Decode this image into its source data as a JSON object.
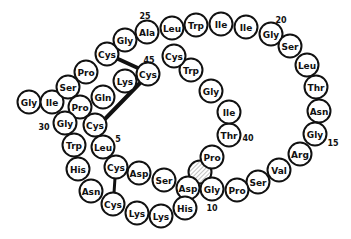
{
  "diagram": {
    "type": "peptide-sequence-loop",
    "residue_radius": 11.5,
    "colors": {
      "outline": "#111111",
      "fill": "#ffffff",
      "hatch": "#aaaaaa"
    },
    "residues": [
      {
        "label": "Gly",
        "x": 29,
        "y": 102
      },
      {
        "label": "Ile",
        "x": 52,
        "y": 102
      },
      {
        "label": "Ser",
        "x": 68,
        "y": 87
      },
      {
        "label": "Pro",
        "x": 80,
        "y": 107
      },
      {
        "label": "Pro",
        "x": 86,
        "y": 72
      },
      {
        "label": "Cys",
        "x": 107,
        "y": 54
      },
      {
        "label": "Gly",
        "x": 125,
        "y": 40
      },
      {
        "label": "Ala",
        "x": 147,
        "y": 32
      },
      {
        "label": "Leu",
        "x": 172,
        "y": 28
      },
      {
        "label": "Trp",
        "x": 196,
        "y": 25
      },
      {
        "label": "Ile",
        "x": 221,
        "y": 24
      },
      {
        "label": "Ile",
        "x": 246,
        "y": 27
      },
      {
        "label": "Gly",
        "x": 271,
        "y": 34
      },
      {
        "label": "Ser",
        "x": 290,
        "y": 46
      },
      {
        "label": "Leu",
        "x": 307,
        "y": 65
      },
      {
        "label": "Thr",
        "x": 316,
        "y": 87
      },
      {
        "label": "Asn",
        "x": 319,
        "y": 111
      },
      {
        "label": "Gly",
        "x": 315,
        "y": 134
      },
      {
        "label": "Arg",
        "x": 300,
        "y": 154
      },
      {
        "label": "Val",
        "x": 279,
        "y": 170
      },
      {
        "label": "Ser",
        "x": 258,
        "y": 182
      },
      {
        "label": "Pro",
        "x": 237,
        "y": 190
      },
      {
        "label": "Gly",
        "x": 212,
        "y": 189
      },
      {
        "label": "Asp",
        "x": 188,
        "y": 188
      },
      {
        "label": "His",
        "x": 185,
        "y": 208
      },
      {
        "label": "Lys",
        "x": 161,
        "y": 216
      },
      {
        "label": "Lys",
        "x": 137,
        "y": 213
      },
      {
        "label": "Cys",
        "x": 113,
        "y": 204
      },
      {
        "label": "Asn",
        "x": 91,
        "y": 191
      },
      {
        "label": "His",
        "x": 78,
        "y": 169
      },
      {
        "label": "Trp",
        "x": 74,
        "y": 145
      },
      {
        "label": "Gly",
        "x": 65,
        "y": 123
      },
      {
        "label": "Cys",
        "x": 95,
        "y": 125
      },
      {
        "label": "Leu",
        "x": 103,
        "y": 147
      },
      {
        "label": "Cys",
        "x": 116,
        "y": 167
      },
      {
        "label": "Asp",
        "x": 139,
        "y": 173
      },
      {
        "label": "Ser",
        "x": 164,
        "y": 180
      },
      {
        "label": "Pro",
        "x": 212,
        "y": 157
      },
      {
        "label": "Thr",
        "x": 229,
        "y": 135
      },
      {
        "label": "Ile",
        "x": 229,
        "y": 112
      },
      {
        "label": "Gly",
        "x": 211,
        "y": 91
      },
      {
        "label": "Trp",
        "x": 191,
        "y": 70
      },
      {
        "label": "Cys",
        "x": 174,
        "y": 56
      },
      {
        "label": "Cys",
        "x": 148,
        "y": 74
      },
      {
        "label": "Lys",
        "x": 125,
        "y": 81
      },
      {
        "label": "Gln",
        "x": 103,
        "y": 97
      }
    ],
    "position_numbers": [
      {
        "label": "25",
        "x": 145,
        "y": 16
      },
      {
        "label": "20",
        "x": 281,
        "y": 20
      },
      {
        "label": "45",
        "x": 149,
        "y": 60
      },
      {
        "label": "40",
        "x": 248,
        "y": 138
      },
      {
        "label": "15",
        "x": 333,
        "y": 143
      },
      {
        "label": "10",
        "x": 212,
        "y": 208
      },
      {
        "label": "5",
        "x": 118,
        "y": 139
      },
      {
        "label": "30",
        "x": 44,
        "y": 127
      }
    ],
    "disulfide_bonds": [
      {
        "x1": 116,
        "y1": 58,
        "x2": 140,
        "y2": 69,
        "width": 4
      },
      {
        "x1": 141,
        "y1": 82,
        "x2": 104,
        "y2": 120,
        "width": 4
      },
      {
        "x1": 115,
        "y1": 178,
        "x2": 114,
        "y2": 193,
        "width": 3
      }
    ],
    "hatched_marker": {
      "x": 200,
      "y": 172
    }
  }
}
